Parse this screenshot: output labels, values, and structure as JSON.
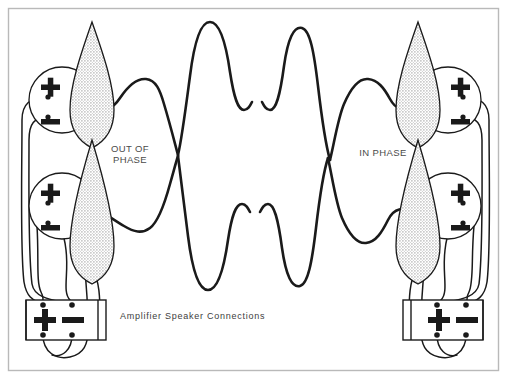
{
  "figure": {
    "title": "Amplifier Speaker Connections",
    "frame_color": "#b9b9b9",
    "ink_color": "#1a1a1a",
    "cone_fill_color": "#d9d9d9",
    "label_color": "#4a4a4a",
    "background_color": "#ffffff"
  },
  "labels": {
    "out_of_phase_line1": "OUT OF",
    "out_of_phase_line2": "PHASE",
    "in_phase": "IN PHASE",
    "caption": "Amplifier Speaker Connections"
  },
  "polarity": {
    "plus": "+",
    "minus": "−"
  },
  "speakers": [
    {
      "id": "speaker-top-left",
      "group": "out-of-phase",
      "position": "top-left",
      "cone_apex_x": 92,
      "cone_top_y": 22,
      "cone_bottom_y": 148,
      "cone_half_width": 22,
      "magnet_cx": 62,
      "magnet_cy": 100,
      "magnet_r": 33,
      "magnet_side": "left",
      "terminals": [
        {
          "name": "plus",
          "symbol": "+",
          "x": 50,
          "y": 88,
          "dot_x": 48,
          "dot_y": 97
        },
        {
          "name": "minus",
          "symbol": "−",
          "x": 50,
          "y": 122,
          "dot_x": 48,
          "dot_y": 117
        }
      ]
    },
    {
      "id": "speaker-bottom-left",
      "group": "out-of-phase",
      "position": "bottom-left",
      "cone_apex_x": 92,
      "cone_top_y": 140,
      "cone_bottom_y": 282,
      "cone_half_width": 22,
      "magnet_cx": 62,
      "magnet_cy": 206,
      "magnet_r": 33,
      "magnet_side": "left",
      "terminals": [
        {
          "name": "plus",
          "symbol": "+",
          "x": 50,
          "y": 194,
          "dot_x": 48,
          "dot_y": 203
        },
        {
          "name": "minus",
          "symbol": "−",
          "x": 50,
          "y": 228,
          "dot_x": 48,
          "dot_y": 223
        }
      ]
    },
    {
      "id": "speaker-top-right",
      "group": "in-phase",
      "position": "top-right",
      "cone_apex_x": 418,
      "cone_top_y": 22,
      "cone_bottom_y": 148,
      "cone_half_width": 22,
      "magnet_cx": 448,
      "magnet_cy": 100,
      "magnet_r": 33,
      "magnet_side": "right",
      "terminals": [
        {
          "name": "plus",
          "symbol": "+",
          "x": 461,
          "y": 88,
          "dot_x": 463,
          "dot_y": 97
        },
        {
          "name": "minus",
          "symbol": "−",
          "x": 461,
          "y": 122,
          "dot_x": 463,
          "dot_y": 117
        }
      ]
    },
    {
      "id": "speaker-bottom-right",
      "group": "in-phase",
      "position": "bottom-right",
      "cone_apex_x": 418,
      "cone_top_y": 140,
      "cone_bottom_y": 282,
      "cone_half_width": 22,
      "magnet_cx": 448,
      "magnet_cy": 206,
      "magnet_r": 33,
      "magnet_side": "right",
      "terminals": [
        {
          "name": "plus",
          "symbol": "+",
          "x": 461,
          "y": 194,
          "dot_x": 463,
          "dot_y": 203
        },
        {
          "name": "minus",
          "symbol": "−",
          "x": 461,
          "y": 228,
          "dot_x": 463,
          "dot_y": 223
        }
      ]
    }
  ],
  "amplifiers": [
    {
      "id": "amplifier-left",
      "position": "bottom-left",
      "x": 26,
      "y": 300,
      "width": 80,
      "height": 40,
      "plus_symbol": "+",
      "minus_symbol": "−",
      "terminal_dots": [
        {
          "name": "top-left",
          "x": 43,
          "y": 305
        },
        {
          "name": "top-right",
          "x": 72,
          "y": 305
        },
        {
          "name": "bottom-left",
          "x": 43,
          "y": 335
        },
        {
          "name": "bottom-right",
          "x": 72,
          "y": 335
        }
      ]
    },
    {
      "id": "amplifier-right",
      "position": "bottom-right",
      "x": 403,
      "y": 300,
      "width": 80,
      "height": 40,
      "plus_symbol": "+",
      "minus_symbol": "−",
      "terminal_dots": [
        {
          "name": "top-left",
          "x": 437,
          "y": 305
        },
        {
          "name": "top-right",
          "x": 466,
          "y": 305
        },
        {
          "name": "bottom-left",
          "x": 437,
          "y": 335
        },
        {
          "name": "bottom-right",
          "x": 466,
          "y": 335
        }
      ]
    }
  ],
  "waveforms": [
    {
      "id": "waveform-upper",
      "description": "Upper sound wave travelling between the two top speakers, out of phase on the left half",
      "stroke_width": 2.6
    },
    {
      "id": "waveform-lower",
      "description": "Lower sound wave travelling between the two bottom speakers, in phase on the right half",
      "stroke_width": 2.6
    }
  ]
}
